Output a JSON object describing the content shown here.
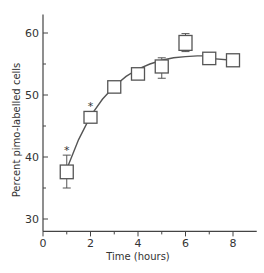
{
  "chart_data": {
    "type": "line",
    "title": "",
    "xlabel": "Time (hours)",
    "ylabel": "Percent pimo-labelled cells",
    "xlim": [
      0,
      9
    ],
    "ylim": [
      28,
      63
    ],
    "x_ticks": [
      0,
      2,
      4,
      6,
      8
    ],
    "x_minor_ticks": [
      1,
      3,
      5,
      7
    ],
    "y_ticks": [
      30,
      40,
      50,
      60
    ],
    "y_minor_ticks": [
      35,
      45,
      55
    ],
    "grid": false,
    "legend": null,
    "series": [
      {
        "name": "Percent pimo-labelled cells",
        "marker": "square-box",
        "points": [
          {
            "x": 1,
            "y": 37.6,
            "box_low": 36.5,
            "box_high": 38.7,
            "err_low": 35.0,
            "err_high": 40.3,
            "significant": true
          },
          {
            "x": 2,
            "y": 46.4,
            "box_low": 45.4,
            "box_high": 47.3,
            "err_low": 45.4,
            "err_high": 47.3,
            "significant": true
          },
          {
            "x": 3,
            "y": 51.3,
            "box_low": 50.3,
            "box_high": 52.3,
            "err_low": 50.3,
            "err_high": 52.3,
            "significant": false
          },
          {
            "x": 4,
            "y": 53.4,
            "box_low": 52.4,
            "box_high": 54.4,
            "err_low": 52.4,
            "err_high": 54.4,
            "significant": false
          },
          {
            "x": 5,
            "y": 54.6,
            "box_low": 53.6,
            "box_high": 55.7,
            "err_low": 52.7,
            "err_high": 56.0,
            "significant": false
          },
          {
            "x": 6,
            "y": 58.4,
            "box_low": 57.2,
            "box_high": 59.6,
            "err_low": 57.0,
            "err_high": 59.9,
            "significant": false
          },
          {
            "x": 7,
            "y": 55.9,
            "box_low": 54.9,
            "box_high": 56.9,
            "err_low": 54.9,
            "err_high": 56.9,
            "significant": false
          },
          {
            "x": 8,
            "y": 55.6,
            "box_low": 54.5,
            "box_high": 56.6,
            "err_low": 54.5,
            "err_high": 56.6,
            "significant": false
          }
        ],
        "fit_curve": {
          "type": "exponential-saturation",
          "x": [
            1.05,
            1.5,
            2,
            2.5,
            3,
            3.5,
            4,
            4.5,
            5,
            5.5,
            6,
            6.5,
            7
          ],
          "y": [
            38.5,
            42.8,
            46.6,
            49.3,
            51.4,
            53.0,
            54.2,
            55.0,
            55.6,
            56.0,
            56.2,
            56.3,
            56.3
          ]
        },
        "tail_segment": {
          "x": [
            7,
            8
          ],
          "y": [
            55.9,
            55.6
          ]
        }
      }
    ],
    "annotations": [
      {
        "text": "*",
        "x": 1,
        "y": 41.2
      },
      {
        "text": "*",
        "x": 2,
        "y": 48.3
      }
    ]
  },
  "style": {
    "line_color": "#555555",
    "axis_color": "#444444",
    "background": "#ffffff"
  }
}
